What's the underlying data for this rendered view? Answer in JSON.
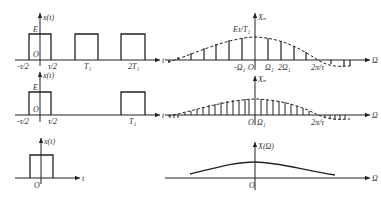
{
  "rows": [
    {
      "time": {
        "ylabel": "x(t)",
        "xlabel": "t",
        "amp_label": "E",
        "origin": "O",
        "ticks": [
          "-τ/2",
          "τ/2",
          "T₁",
          "2T₁"
        ]
      },
      "spectrum": {
        "ylabel": "Xₙ",
        "xlabel": "Ω",
        "peak_label": "Eτ/T₁",
        "ticks": [
          "-Ω₁",
          "O",
          "Ω₁",
          "2Ω₁",
          "2π/τ"
        ]
      }
    },
    {
      "time": {
        "ylabel": "x(t)",
        "xlabel": "t",
        "amp_label": "E",
        "origin": "O",
        "ticks": [
          "-τ/2",
          "τ/2",
          "T₁"
        ]
      },
      "spectrum": {
        "ylabel": "Xₙ",
        "xlabel": "Ω",
        "ticks": [
          "O",
          "Ω₁",
          "2π/τ"
        ]
      }
    },
    {
      "time": {
        "ylabel": "x(t)",
        "xlabel": "t",
        "origin": "O"
      },
      "spectrum": {
        "ylabel": "X(Ω)",
        "xlabel": "Ω",
        "origin": "O"
      }
    }
  ]
}
